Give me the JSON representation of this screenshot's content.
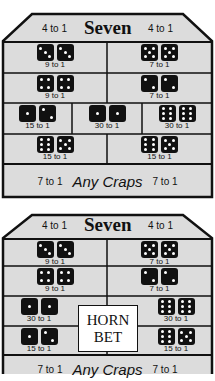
{
  "colors": {
    "panel_bg": "#dcdcdc",
    "border": "#111111",
    "die": "#111111",
    "pip": "#ffffff",
    "horn_bg": "#ffffff"
  },
  "panels": [
    {
      "name": "proposition-layout-standard",
      "header": {
        "left_odds": "4 to 1",
        "title": "Seven",
        "right_odds": "4 to 1"
      },
      "rows": [
        [
          {
            "dice": [
              3,
              3
            ],
            "odds": "9 to 1"
          },
          {
            "dice": [
              5,
              5
            ],
            "odds": "7 to 1"
          }
        ],
        [
          {
            "dice": [
              4,
              4
            ],
            "odds": "9 to 1"
          },
          {
            "dice": [
              2,
              2
            ],
            "odds": "7 to 1"
          }
        ],
        [
          {
            "dice": [
              1,
              2
            ],
            "odds": "15 to 1"
          },
          {
            "dice": [
              1,
              1
            ],
            "odds": "30 to 1"
          },
          {
            "dice": [
              6,
              6
            ],
            "odds": "30 to 1"
          }
        ],
        [
          {
            "dice": [
              6,
              5
            ],
            "odds": "15 to 1"
          },
          {
            "dice": [
              6,
              5
            ],
            "odds": "15 to 1"
          }
        ]
      ],
      "footer": {
        "left_odds": "7 to 1",
        "label": "Any Craps",
        "right_odds": "7 to 1"
      }
    },
    {
      "name": "proposition-layout-horn",
      "header": {
        "left_odds": "4 to 1",
        "title": "Seven",
        "right_odds": "4 to 1"
      },
      "rows": [
        [
          {
            "dice": [
              3,
              3
            ],
            "odds": "9 to 1"
          },
          {
            "dice": [
              5,
              5
            ],
            "odds": "7 to 1"
          }
        ],
        [
          {
            "dice": [
              4,
              4
            ],
            "odds": "9 to 1"
          },
          {
            "dice": [
              2,
              2
            ],
            "odds": "7 to 1"
          }
        ],
        [
          {
            "dice": [
              1,
              1
            ],
            "odds": "30 to 1"
          },
          {
            "dice": [
              6,
              6
            ],
            "odds": "30 to 1"
          }
        ],
        [
          {
            "dice": [
              1,
              2
            ],
            "odds": "15 to 1"
          },
          {
            "dice": [
              6,
              5
            ],
            "odds": "15 to 1"
          }
        ]
      ],
      "horn": {
        "line1": "HORN",
        "line2": "BET"
      },
      "footer": {
        "left_odds": "7 to 1",
        "label": "Any Craps",
        "right_odds": "7 to 1"
      }
    }
  ]
}
